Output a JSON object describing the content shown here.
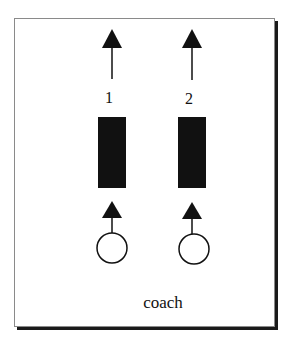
{
  "diagram": {
    "lanes": [
      {
        "number_label": "1",
        "x": 112
      },
      {
        "number_label": "2",
        "x": 192
      }
    ],
    "caption": "coach",
    "colors": {
      "ink": "#111111",
      "border": "#8a8a8a",
      "shadow": "#1a1a1a",
      "background": "#ffffff"
    }
  }
}
